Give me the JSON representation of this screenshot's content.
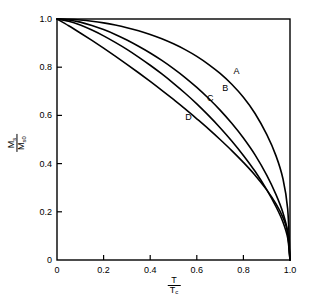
{
  "chart_data": {
    "type": "line",
    "title": "",
    "subtitle": "",
    "xlabel": "T / Tc",
    "ylabel": "Ms / Ms0",
    "xlabel_numerator": "T",
    "xlabel_denominator": "T",
    "xlabel_denominator_sub": "c",
    "ylabel_numerator": "M",
    "ylabel_numerator_sub": "s",
    "ylabel_denominator": "M",
    "ylabel_denominator_sub": "s0",
    "xlim": [
      0,
      1.0
    ],
    "ylim": [
      0,
      1.0
    ],
    "grid": false,
    "legend": "inline-curve-labels",
    "xticks": [
      0,
      0.2,
      0.4,
      0.6,
      0.8,
      1.0
    ],
    "xticklabels": [
      "0",
      "0.2",
      "0.4",
      "0.6",
      "0.8",
      "1.0"
    ],
    "yticks": [
      0,
      0.2,
      0.4,
      0.6,
      0.8,
      1.0
    ],
    "yticklabels": [
      "0",
      "0.2",
      "0.4",
      "0.6",
      "0.8",
      "1.0"
    ],
    "line_color": "#000000",
    "line_width": 1.6,
    "frame_color": "#000000",
    "background": "#ffffff",
    "x": [
      0,
      0.05,
      0.1,
      0.15,
      0.2,
      0.25,
      0.3,
      0.35,
      0.4,
      0.45,
      0.5,
      0.55,
      0.6,
      0.65,
      0.7,
      0.75,
      0.8,
      0.85,
      0.9,
      0.94,
      0.97,
      0.99,
      1.0
    ],
    "series": [
      {
        "name": "A",
        "label": "A",
        "label_x": 0.77,
        "label_y": 0.783,
        "values": [
          1.0,
          0.999,
          0.996,
          0.991,
          0.984,
          0.975,
          0.964,
          0.951,
          0.936,
          0.918,
          0.897,
          0.873,
          0.845,
          0.812,
          0.774,
          0.729,
          0.675,
          0.608,
          0.521,
          0.432,
          0.336,
          0.212,
          0.0
        ]
      },
      {
        "name": "B",
        "label": "B",
        "label_x": 0.722,
        "label_y": 0.712,
        "values": [
          1.0,
          0.996,
          0.987,
          0.973,
          0.956,
          0.936,
          0.913,
          0.887,
          0.859,
          0.828,
          0.794,
          0.757,
          0.716,
          0.671,
          0.622,
          0.567,
          0.506,
          0.436,
          0.352,
          0.271,
          0.195,
          0.116,
          0.0
        ]
      },
      {
        "name": "C",
        "label": "C",
        "label_x": 0.658,
        "label_y": 0.672,
        "values": [
          1.0,
          0.991,
          0.975,
          0.954,
          0.93,
          0.903,
          0.874,
          0.842,
          0.808,
          0.772,
          0.733,
          0.692,
          0.648,
          0.6,
          0.549,
          0.494,
          0.434,
          0.368,
          0.292,
          0.221,
          0.157,
          0.092,
          0.0
        ]
      },
      {
        "name": "D",
        "label": "D",
        "label_x": 0.564,
        "label_y": 0.595,
        "values": [
          1.0,
          0.972,
          0.942,
          0.911,
          0.879,
          0.846,
          0.812,
          0.777,
          0.741,
          0.704,
          0.666,
          0.627,
          0.586,
          0.544,
          0.5,
          0.454,
          0.405,
          0.352,
          0.291,
          0.233,
          0.176,
          0.115,
          0.0
        ]
      }
    ]
  },
  "plot_box": {
    "left": 57,
    "top": 19,
    "right": 290,
    "bottom": 260
  }
}
